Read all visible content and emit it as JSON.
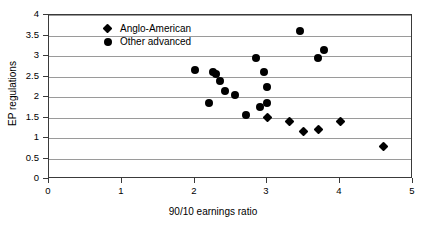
{
  "chart_data": {
    "type": "scatter",
    "title": "",
    "xlabel": "90/10 earnings ratio",
    "ylabel": "EP regulations",
    "xlim": [
      0,
      5
    ],
    "ylim": [
      0,
      4
    ],
    "xticks": [
      0,
      1,
      2,
      3,
      4,
      5
    ],
    "yticks": [
      0,
      0.5,
      1,
      1.5,
      2,
      2.5,
      3,
      3.5,
      4
    ],
    "xtick_labels": [
      "0",
      "1",
      "2",
      "3",
      "4",
      "5"
    ],
    "ytick_labels": [
      "0",
      "0.5",
      "1",
      "1.5",
      "2",
      "2.5",
      "3",
      "3.5",
      "4"
    ],
    "grid": "horizontal",
    "legend_position": "upper-left-inside",
    "series": [
      {
        "name": "Anglo-American",
        "marker": "diamond",
        "color": "#000000",
        "points": [
          {
            "x": 3.0,
            "y": 1.5
          },
          {
            "x": 3.3,
            "y": 1.4
          },
          {
            "x": 3.5,
            "y": 1.15
          },
          {
            "x": 3.7,
            "y": 1.2
          },
          {
            "x": 4.0,
            "y": 1.4
          },
          {
            "x": 4.6,
            "y": 0.8
          }
        ]
      },
      {
        "name": "Other advanced",
        "marker": "circle",
        "color": "#000000",
        "points": [
          {
            "x": 2.0,
            "y": 2.65
          },
          {
            "x": 2.2,
            "y": 1.85
          },
          {
            "x": 2.25,
            "y": 2.6
          },
          {
            "x": 2.3,
            "y": 2.55
          },
          {
            "x": 2.35,
            "y": 2.4
          },
          {
            "x": 2.42,
            "y": 2.15
          },
          {
            "x": 2.55,
            "y": 2.05
          },
          {
            "x": 2.7,
            "y": 1.55
          },
          {
            "x": 2.85,
            "y": 2.95
          },
          {
            "x": 2.9,
            "y": 1.75
          },
          {
            "x": 2.95,
            "y": 2.6
          },
          {
            "x": 3.0,
            "y": 1.85
          },
          {
            "x": 3.0,
            "y": 2.25
          },
          {
            "x": 3.45,
            "y": 3.6
          },
          {
            "x": 3.7,
            "y": 2.95
          },
          {
            "x": 3.78,
            "y": 3.15
          }
        ]
      }
    ]
  },
  "legend": {
    "items": [
      {
        "label": "Anglo-American",
        "marker": "diamond"
      },
      {
        "label": "Other advanced",
        "marker": "circle"
      }
    ]
  }
}
